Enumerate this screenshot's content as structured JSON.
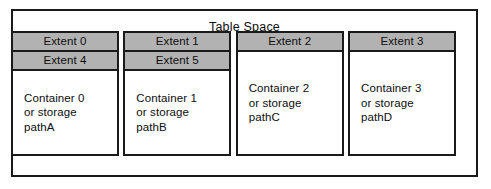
{
  "diagram": {
    "title": "Table Space",
    "colors": {
      "extent_fill": "#b2b2b2",
      "border": "#1a1a1a",
      "background": "#ffffff",
      "text": "#0d0d0d"
    },
    "containers": [
      {
        "extents": [
          "Extent 0",
          "Extent 4"
        ],
        "label": "Container 0\nor storage\npathA"
      },
      {
        "extents": [
          "Extent 1",
          "Extent 5"
        ],
        "label": "Container 1\nor storage\npathB"
      },
      {
        "extents": [
          "Extent 2"
        ],
        "label": "Container 2\nor storage\npathC"
      },
      {
        "extents": [
          "Extent 3"
        ],
        "label": "Container 3\nor storage\npathD"
      }
    ]
  }
}
